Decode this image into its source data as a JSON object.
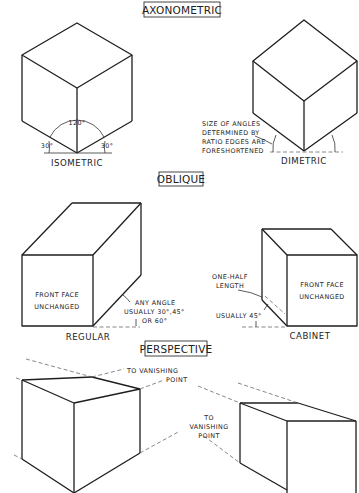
{
  "sections": {
    "axonometric": {
      "header": "AXONOMETRIC",
      "isometric": {
        "label": "ISOMETRIC",
        "angle_top": "120°",
        "angle_left": "30°",
        "angle_right": "30°"
      },
      "dimetric": {
        "label": "DIMETRIC",
        "note_lines": [
          "SIZE OF ANGLES",
          "DETERMINED BY",
          "RATIO EDGES ARE",
          "FORESHORTENED"
        ]
      }
    },
    "oblique": {
      "header": "OBLIQUE",
      "regular": {
        "label": "REGULAR",
        "face_lines": [
          "FRONT FACE",
          "UNCHANGED"
        ],
        "note_lines": [
          "ANY ANGLE",
          "USUALLY 30°,45°",
          "OR 60°"
        ]
      },
      "cabinet": {
        "label": "CABINET",
        "face_lines": [
          "FRONT FACE",
          "UNCHANGED"
        ],
        "depth_note_lines": [
          "ONE-HALF",
          "LENGTH"
        ],
        "angle_note": "USUALLY 45°"
      }
    },
    "perspective": {
      "header": "PERSPECTIVE",
      "note_top_lines": [
        "TO VANISHING",
        "POINT"
      ],
      "note_mid_lines": [
        "TO",
        "VANISHING",
        "POINT"
      ]
    }
  }
}
